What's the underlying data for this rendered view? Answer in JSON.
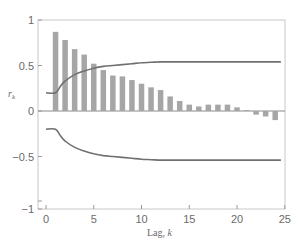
{
  "chart_data": {
    "type": "bar",
    "title": "",
    "xlabel": "Lag, k",
    "ylabel": "r_k",
    "xlim": [
      -0.8,
      25
    ],
    "ylim": [
      -1.05,
      1
    ],
    "xticks": [
      0,
      5,
      10,
      15,
      20,
      25
    ],
    "yticks": [
      -1,
      -0.5,
      0,
      0.5,
      1
    ],
    "ytick_labels": [
      "−1",
      "−0.5",
      "0",
      "0.5",
      "1"
    ],
    "grid": false,
    "legend": null,
    "categories": [
      1,
      2,
      3,
      4,
      5,
      6,
      7,
      8,
      9,
      10,
      11,
      12,
      13,
      14,
      15,
      16,
      17,
      18,
      19,
      20,
      21,
      22,
      23,
      24
    ],
    "series": [
      {
        "name": "Sample autocorrelation r_k",
        "kind": "bar",
        "color": "#a6a6a6",
        "values": [
          0.87,
          0.78,
          0.68,
          0.62,
          0.52,
          0.45,
          0.39,
          0.38,
          0.34,
          0.3,
          0.26,
          0.23,
          0.16,
          0.11,
          0.07,
          0.05,
          0.07,
          0.07,
          0.07,
          0.04,
          0.01,
          -0.04,
          -0.06,
          -0.1
        ]
      },
      {
        "name": "Upper confidence limit",
        "kind": "line",
        "color": "#707070",
        "x": [
          0,
          1,
          1.5,
          2,
          3,
          4,
          5,
          6,
          7,
          8,
          9,
          10,
          11,
          12,
          13,
          24.6
        ],
        "values": [
          0.2,
          0.2,
          0.27,
          0.33,
          0.4,
          0.44,
          0.47,
          0.49,
          0.5,
          0.51,
          0.52,
          0.53,
          0.535,
          0.54,
          0.54,
          0.54
        ]
      },
      {
        "name": "Lower confidence limit",
        "kind": "line",
        "color": "#707070",
        "x": [
          0,
          1,
          1.5,
          2,
          3,
          4,
          5,
          6,
          7,
          8,
          9,
          10,
          11,
          12,
          13,
          24.6
        ],
        "values": [
          -0.2,
          -0.2,
          -0.27,
          -0.33,
          -0.4,
          -0.44,
          -0.47,
          -0.49,
          -0.5,
          -0.51,
          -0.52,
          -0.53,
          -0.535,
          -0.54,
          -0.54,
          -0.54
        ]
      }
    ]
  },
  "labels": {
    "xlabel_text": "Lag, ",
    "xlabel_var": "k",
    "ylabel_var": "r",
    "ylabel_sub": "k"
  }
}
